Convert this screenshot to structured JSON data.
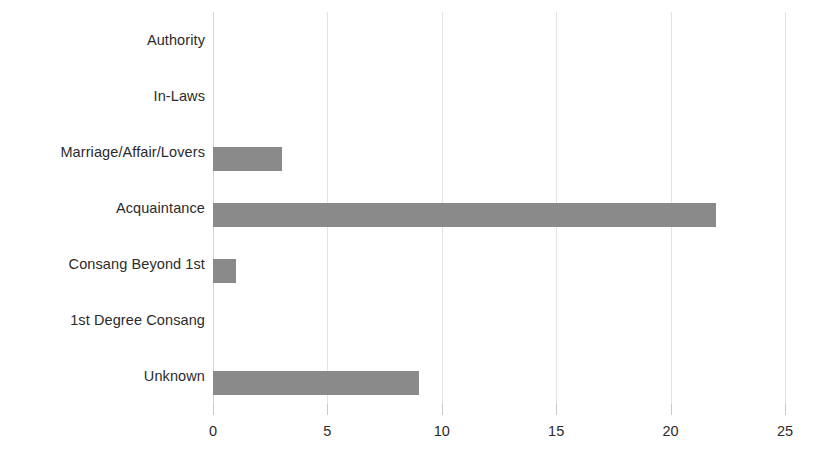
{
  "chart_data": {
    "type": "bar",
    "orientation": "horizontal",
    "title": "",
    "subtitle": "",
    "xlabel": "",
    "ylabel": "",
    "categories": [
      "Authority",
      "In-Laws",
      "Marriage/Affair/Lovers",
      "Acquaintance",
      "Consang Beyond 1st",
      "1st Degree Consang",
      "Unknown"
    ],
    "values": [
      0,
      0,
      3,
      22,
      1,
      0,
      9
    ],
    "xlim": [
      0,
      25
    ],
    "xticks": [
      0,
      5,
      10,
      15,
      20,
      25
    ],
    "xtick_labels": [
      "0",
      "5",
      "10",
      "15",
      "20",
      "25"
    ],
    "grid": "vertical",
    "legend": null,
    "series": [
      {
        "name": "",
        "values": [
          0,
          0,
          3,
          22,
          1,
          0,
          9
        ],
        "color": "#8a8a8a"
      }
    ],
    "colors": {
      "bar": "#8a8a8a",
      "gridline": "#e2e2e2",
      "axis": "#d6d6d6",
      "text": "#2b2b2b",
      "background": "#ffffff"
    }
  }
}
